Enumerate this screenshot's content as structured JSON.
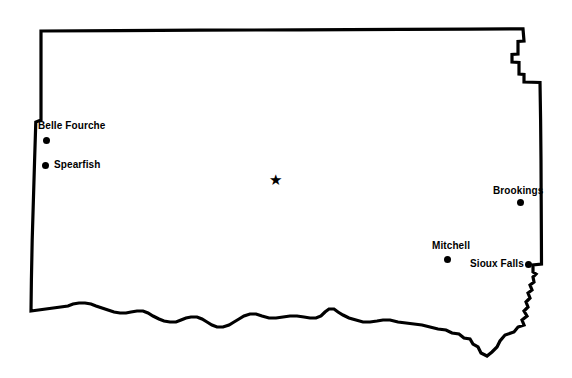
{
  "map": {
    "title": "South Dakota",
    "background_color": "#ffffff",
    "outline_color": "#000000",
    "outline_width": 3,
    "width": 572,
    "height": 378
  },
  "capital": {
    "name": "Pierre",
    "marker": "star-icon",
    "glyph": "★",
    "label_visible": false,
    "x": 276,
    "y": 180
  },
  "cities": [
    {
      "name": "Belle Fourche",
      "label": "Belle Fourche",
      "marker": "city-dot-icon",
      "dot_x": 46,
      "dot_y": 140,
      "label_x": 38,
      "label_y": 120,
      "label_position": "above"
    },
    {
      "name": "Spearfish",
      "label": "Spearfish",
      "marker": "city-dot-icon",
      "dot_x": 45,
      "dot_y": 165,
      "label_x": 54,
      "label_y": 159,
      "label_position": "right"
    },
    {
      "name": "Brookings",
      "label": "Brookings",
      "marker": "city-dot-icon",
      "dot_x": 520,
      "dot_y": 202,
      "label_x": 493,
      "label_y": 185,
      "label_position": "above"
    },
    {
      "name": "Mitchell",
      "label": "Mitchell",
      "marker": "city-dot-icon",
      "dot_x": 447,
      "dot_y": 259,
      "label_x": 432,
      "label_y": 240,
      "label_position": "above"
    },
    {
      "name": "Sioux Falls",
      "label": "Sioux Falls",
      "marker": "city-dot-icon",
      "dot_x": 528,
      "dot_y": 264,
      "label_x": 470,
      "label_y": 258,
      "label_position": "left"
    }
  ]
}
